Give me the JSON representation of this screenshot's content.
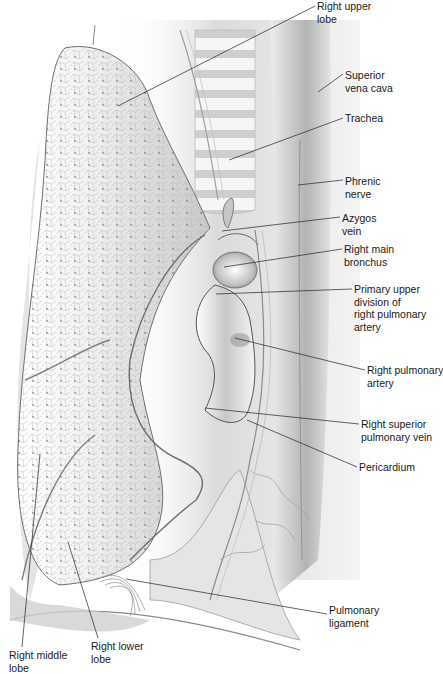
{
  "figure": {
    "labels": [
      {
        "id": "right-upper-lobe",
        "text": "Right upper\nlobe",
        "x": 317,
        "y": 0,
        "line": [
          [
            315,
            6
          ],
          [
            118,
            106
          ]
        ]
      },
      {
        "id": "superior-vena-cava",
        "text": "Superior\nvena cava",
        "x": 345,
        "y": 69,
        "line": [
          [
            343,
            74
          ],
          [
            318,
            92
          ]
        ]
      },
      {
        "id": "trachea",
        "text": "Trachea",
        "x": 345,
        "y": 112,
        "line": [
          [
            343,
            118
          ],
          [
            229,
            160
          ]
        ]
      },
      {
        "id": "phrenic-nerve",
        "text": "Phrenic\nnerve",
        "x": 345,
        "y": 175,
        "line": [
          [
            343,
            180
          ],
          [
            298,
            185
          ]
        ]
      },
      {
        "id": "azygos-vein",
        "text": "Azygos\nvein",
        "x": 342,
        "y": 212,
        "line": [
          [
            340,
            217
          ],
          [
            222,
            231
          ]
        ]
      },
      {
        "id": "right-main-bronchus",
        "text": "Right main\nbronchus",
        "x": 344,
        "y": 243,
        "line": [
          [
            342,
            249
          ],
          [
            224,
            267
          ]
        ]
      },
      {
        "id": "primary-upper-division",
        "text": "Primary upper\ndivision of\nright pulmonary\nartery",
        "x": 354,
        "y": 283,
        "line": [
          [
            352,
            289
          ],
          [
            216,
            294
          ]
        ]
      },
      {
        "id": "right-pulmonary-artery",
        "text": "Right pulmonary\nartery",
        "x": 367,
        "y": 364,
        "line": [
          [
            365,
            370
          ],
          [
            235,
            338
          ]
        ]
      },
      {
        "id": "right-superior-pulmonary-vein",
        "text": "Right superior\npulmonary vein",
        "x": 361,
        "y": 418,
        "line": [
          [
            359,
            424
          ],
          [
            205,
            408
          ]
        ]
      },
      {
        "id": "pericardium",
        "text": "Pericardium",
        "x": 359,
        "y": 461,
        "line": [
          [
            357,
            467
          ],
          [
            247,
            420
          ]
        ]
      },
      {
        "id": "pulmonary-ligament",
        "text": "Pulmonary\nligament",
        "x": 329,
        "y": 604,
        "line": [
          [
            327,
            614
          ],
          [
            126,
            579
          ]
        ]
      },
      {
        "id": "right-middle-lobe",
        "text": "Right middle\nlobe",
        "x": 9,
        "y": 649,
        "line": [
          [
            22,
            647
          ],
          [
            40,
            454
          ]
        ]
      },
      {
        "id": "right-lower-lobe",
        "text": "Right lower\nlobe",
        "x": 91,
        "y": 640,
        "line": [
          [
            98,
            638
          ],
          [
            68,
            542
          ]
        ]
      }
    ]
  }
}
